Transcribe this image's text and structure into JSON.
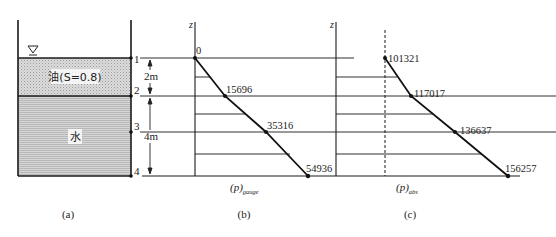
{
  "panel_a": {
    "caption": "(a)",
    "free_surface_symbol": "∇",
    "oil_label": "油(S=0.8)",
    "water_label": "水",
    "points": [
      "1",
      "2",
      "3",
      "4"
    ],
    "dim_top": "2m",
    "dim_bottom": "4m"
  },
  "panel_b": {
    "caption": "(b)",
    "axis_label": "z",
    "xlabel_main": "(p)",
    "xlabel_sub": "gauge",
    "values": [
      "0",
      "15696",
      "35316",
      "54936"
    ]
  },
  "panel_c": {
    "caption": "(c)",
    "axis_label": "z",
    "xlabel_main": "(p)",
    "xlabel_sub": "abs",
    "values": [
      "101321",
      "117017",
      "136637",
      "156257"
    ]
  },
  "colors": {
    "line": "#1a1a1a",
    "oil_fill": "#d2d2d2",
    "water_fill": "#c8c8c8",
    "background": "#ffffff"
  }
}
